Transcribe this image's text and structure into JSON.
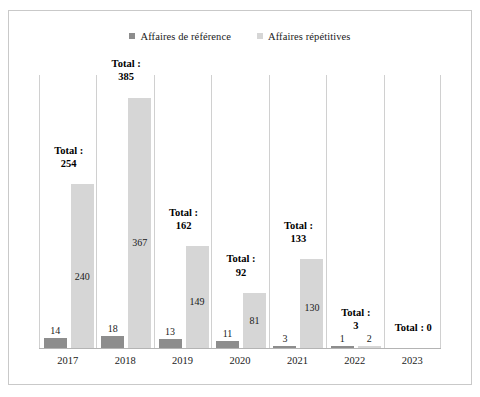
{
  "legend": {
    "items": [
      {
        "label": "Affaires de référence",
        "color": "#8d8d8d",
        "swatch_icon": "square-marker-icon"
      },
      {
        "label": "Affaires répétitives",
        "color": "#d6d6d6",
        "swatch_icon": "square-marker-icon"
      }
    ]
  },
  "chart_data": {
    "type": "bar",
    "title": "",
    "subtitle": "",
    "xlabel": "",
    "ylabel": "",
    "ylim": [
      0,
      400
    ],
    "grid": false,
    "legend_position": "top-center",
    "categories": [
      "2017",
      "2018",
      "2019",
      "2020",
      "2021",
      "2022",
      "2023"
    ],
    "series": [
      {
        "name": "Affaires de référence",
        "color": "#8d8d8d",
        "values": [
          14,
          18,
          13,
          11,
          3,
          1,
          0
        ]
      },
      {
        "name": "Affaires répétitives",
        "color": "#d6d6d6",
        "values": [
          240,
          367,
          149,
          81,
          130,
          2,
          0
        ]
      }
    ],
    "totals": [
      254,
      385,
      162,
      92,
      133,
      3,
      0
    ],
    "total_labels": [
      {
        "line1": "Total :",
        "line2": "254"
      },
      {
        "line1": "Total :",
        "line2": "385"
      },
      {
        "line1": "Total :",
        "line2": "162"
      },
      {
        "line1": "Total :",
        "line2": "92"
      },
      {
        "line1": "Total :",
        "line2": "133"
      },
      {
        "line1": "Total :",
        "line2": "3"
      },
      {
        "line1": "Total : 0",
        "line2": ""
      }
    ],
    "value_labels": {
      "ref": [
        "14",
        "18",
        "13",
        "11",
        "3",
        "1",
        ""
      ],
      "rep": [
        "240",
        "367",
        "149",
        "81",
        "130",
        "2",
        ""
      ]
    },
    "annotations": []
  }
}
